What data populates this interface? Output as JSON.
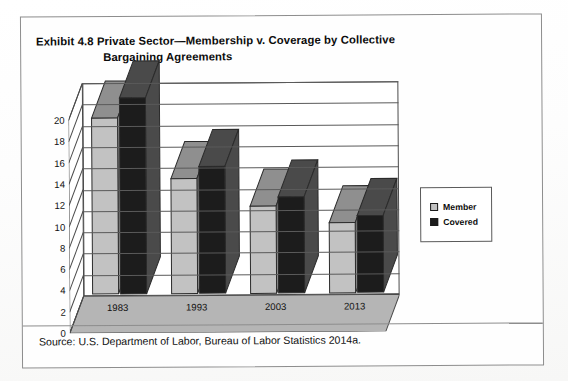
{
  "exhibit": {
    "title_line1": "Exhibit 4.8  Private Sector—Membership v. Coverage by Collective",
    "title_line2": "Bargaining Agreements",
    "source": "Source: U.S. Department of Labor, Bureau of Labor Statistics 2014a."
  },
  "legend": {
    "position": "right",
    "items": [
      {
        "label": "Member",
        "color": "#c2c2c2"
      },
      {
        "label": "Covered",
        "color": "#1c1c1c"
      }
    ]
  },
  "colors": {
    "member_fill": "#c2c2c2",
    "member_top": "#8f8f8f",
    "covered_fill": "#1c1c1c",
    "covered_top": "#4a4a4a",
    "axis": "#4a4a4a",
    "grid": "#5a5a5a",
    "floor": "#a8a8a8",
    "wall": "#ffffff"
  },
  "chart_data": {
    "type": "bar",
    "title": "Exhibit 4.8  Private Sector—Membership v. Coverage by Collective Bargaining Agreements",
    "xlabel": "",
    "ylabel": "",
    "categories": [
      "1983",
      "1993",
      "2003",
      "2013"
    ],
    "series": [
      {
        "name": "Member",
        "values": [
          16.5,
          10.8,
          8.2,
          6.6
        ]
      },
      {
        "name": "Covered",
        "values": [
          18.4,
          11.9,
          9.0,
          7.2
        ]
      }
    ],
    "ylim": [
      0,
      20
    ],
    "yticks": [
      0,
      2,
      4,
      6,
      8,
      10,
      12,
      14,
      16,
      18,
      20
    ],
    "ytick_labels": [
      "0",
      "2",
      "4",
      "6",
      "8",
      "10",
      "12",
      "14",
      "16",
      "18",
      "20"
    ],
    "grid": true,
    "legend_position": "right",
    "three_d": true,
    "source": "Source: U.S. Department of Labor, Bureau of Labor Statistics 2014a."
  }
}
